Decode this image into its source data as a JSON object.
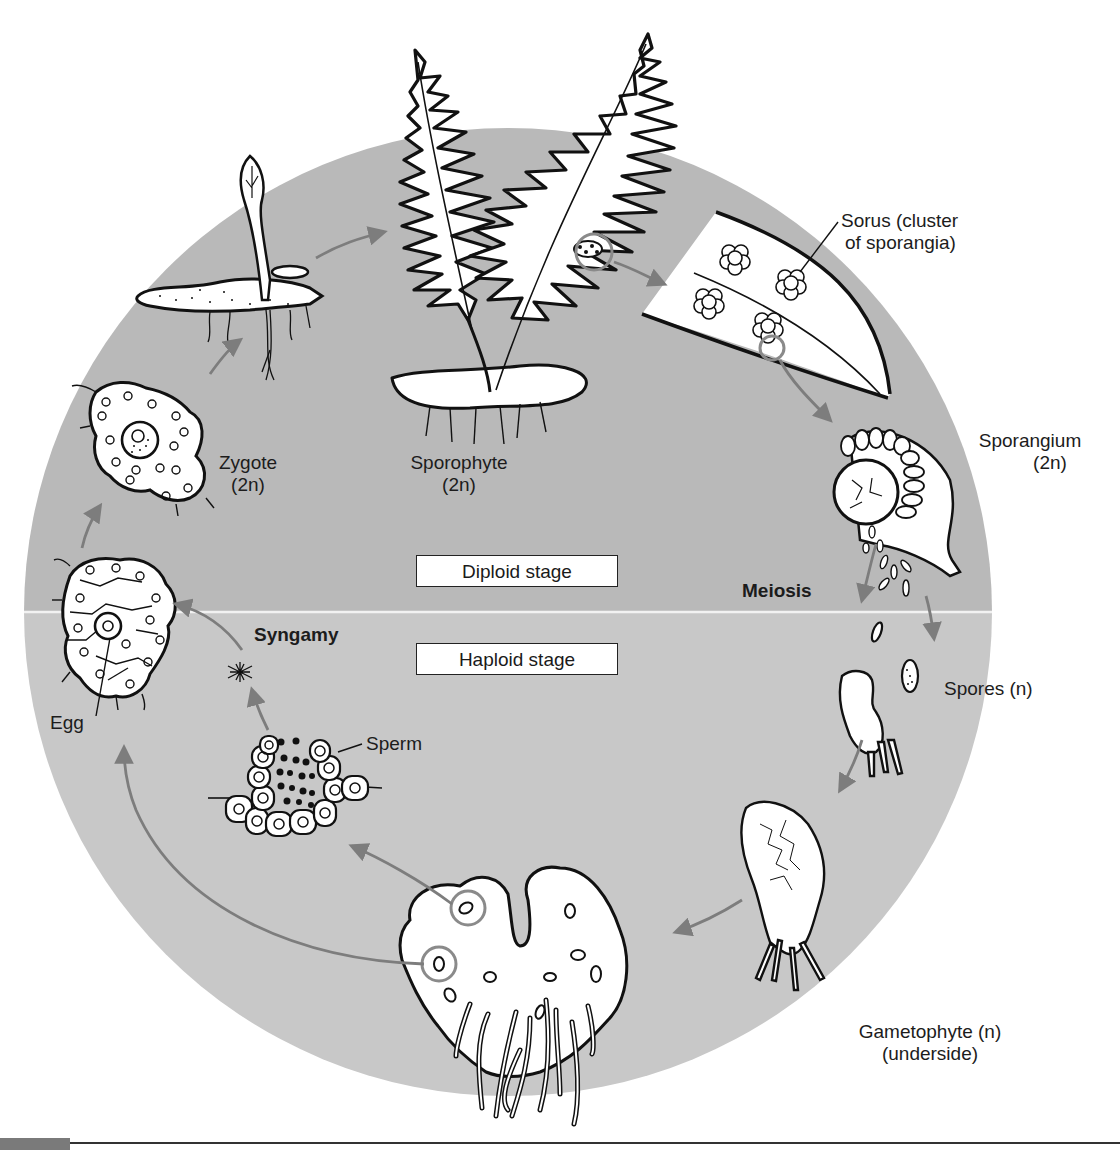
{
  "figure": {
    "colors": {
      "diploid_bg": "#b9b9b9",
      "haploid_bg": "#c8c8c8",
      "divider": "#f2f2f2",
      "arrow": "#7d7d7d",
      "ink": "#111111",
      "highlight_ring": "#8a8a8a"
    },
    "stages": {
      "diploid": "Diploid stage",
      "haploid": "Haploid stage"
    },
    "processes": {
      "meiosis": "Meiosis",
      "syngamy": "Syngamy"
    },
    "labels": {
      "sorus_line1": "Sorus (cluster",
      "sorus_line2": "of sporangia)",
      "sporangium_line1": "Sporangium",
      "sporangium_line2": "(2n)",
      "sporophyte_line1": "Sporophyte",
      "sporophyte_line2": "(2n)",
      "zygote_line1": "Zygote",
      "zygote_line2": "(2n)",
      "spores": "Spores (n)",
      "gametophyte_line1": "Gametophyte (n)",
      "gametophyte_line2": "(underside)",
      "egg": "Egg",
      "sperm": "Sperm"
    },
    "icons": [
      "sporophyte-fern-icon",
      "sorus-leaf-detail-icon",
      "sporangium-icon",
      "spore-icon",
      "young-gametophyte-icon",
      "gametophyte-icon",
      "antheridium-icon",
      "sperm-icon",
      "archegonium-egg-icon",
      "zygote-icon",
      "young-sporophyte-icon",
      "cycle-arrow-icon"
    ]
  }
}
